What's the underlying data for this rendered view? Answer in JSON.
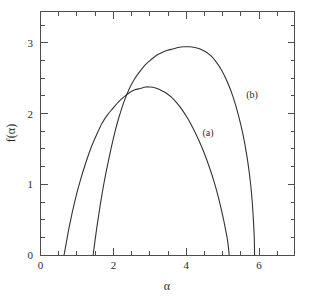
{
  "chart_data": {
    "type": "line",
    "title": "",
    "subtitle": "",
    "xlabel": "α",
    "ylabel": "f(α)",
    "xlim": [
      0,
      7
    ],
    "ylim": [
      0,
      3.45
    ],
    "grid": false,
    "legend_position": "inline-annotations",
    "x_ticks_major": [
      0,
      2,
      4,
      6
    ],
    "x_tick_labels": [
      "0",
      "2",
      "4",
      "6"
    ],
    "x_ticks_minor": [
      0.5,
      1,
      1.5,
      2.5,
      3,
      3.5,
      4.5,
      5,
      5.5,
      6.5,
      7
    ],
    "y_ticks_major": [
      0,
      1,
      2,
      3
    ],
    "y_tick_labels": [
      "0",
      "1",
      "2",
      "3"
    ],
    "y_ticks_minor": [
      0.25,
      0.5,
      0.75,
      1.25,
      1.5,
      1.75,
      2.25,
      2.5,
      2.75,
      3.25
    ],
    "annotations": [
      {
        "text": "(a)",
        "x": 3.72,
        "y": 1.76
      },
      {
        "text": "(b)",
        "x": 5.05,
        "y": 2.3
      }
    ],
    "series": [
      {
        "name": "(a)",
        "label": "(a)",
        "color": "#333333",
        "x_start": 0.65,
        "x_end": 5.2,
        "peak_x": 3.0,
        "peak_y": 2.38,
        "points": [
          [
            0.65,
            0.0
          ],
          [
            0.8,
            0.42
          ],
          [
            0.95,
            0.77
          ],
          [
            1.1,
            1.06
          ],
          [
            1.25,
            1.31
          ],
          [
            1.4,
            1.53
          ],
          [
            1.55,
            1.71
          ],
          [
            1.7,
            1.87
          ],
          [
            1.85,
            1.99
          ],
          [
            2.0,
            2.08
          ],
          [
            2.15,
            2.17
          ],
          [
            2.3,
            2.24
          ],
          [
            2.45,
            2.3
          ],
          [
            2.6,
            2.34
          ],
          [
            2.75,
            2.36
          ],
          [
            2.9,
            2.38
          ],
          [
            3.0,
            2.38
          ],
          [
            3.15,
            2.37
          ],
          [
            3.3,
            2.34
          ],
          [
            3.45,
            2.3
          ],
          [
            3.6,
            2.24
          ],
          [
            3.75,
            2.16
          ],
          [
            3.9,
            2.06
          ],
          [
            4.05,
            1.94
          ],
          [
            4.2,
            1.8
          ],
          [
            4.35,
            1.64
          ],
          [
            4.5,
            1.46
          ],
          [
            4.65,
            1.25
          ],
          [
            4.8,
            1.01
          ],
          [
            4.92,
            0.78
          ],
          [
            5.02,
            0.56
          ],
          [
            5.1,
            0.36
          ],
          [
            5.16,
            0.19
          ],
          [
            5.2,
            0.0
          ]
        ]
      },
      {
        "name": "(b)",
        "label": "(b)",
        "color": "#333333",
        "x_start": 1.45,
        "x_end": 5.9,
        "peak_x": 4.1,
        "peak_y": 2.95,
        "points": [
          [
            1.45,
            0.0
          ],
          [
            1.55,
            0.38
          ],
          [
            1.65,
            0.72
          ],
          [
            1.75,
            1.02
          ],
          [
            1.85,
            1.28
          ],
          [
            1.95,
            1.52
          ],
          [
            2.05,
            1.74
          ],
          [
            2.15,
            1.93
          ],
          [
            2.3,
            2.17
          ],
          [
            2.45,
            2.36
          ],
          [
            2.6,
            2.5
          ],
          [
            2.75,
            2.61
          ],
          [
            2.9,
            2.7
          ],
          [
            3.05,
            2.77
          ],
          [
            3.2,
            2.83
          ],
          [
            3.35,
            2.87
          ],
          [
            3.5,
            2.9
          ],
          [
            3.65,
            2.92
          ],
          [
            3.8,
            2.94
          ],
          [
            3.95,
            2.95
          ],
          [
            4.1,
            2.95
          ],
          [
            4.25,
            2.94
          ],
          [
            4.4,
            2.92
          ],
          [
            4.55,
            2.88
          ],
          [
            4.7,
            2.82
          ],
          [
            4.85,
            2.73
          ],
          [
            5.0,
            2.61
          ],
          [
            5.15,
            2.45
          ],
          [
            5.3,
            2.25
          ],
          [
            5.45,
            1.99
          ],
          [
            5.58,
            1.71
          ],
          [
            5.68,
            1.43
          ],
          [
            5.76,
            1.14
          ],
          [
            5.82,
            0.85
          ],
          [
            5.86,
            0.56
          ],
          [
            5.89,
            0.26
          ],
          [
            5.9,
            0.0
          ]
        ]
      }
    ]
  },
  "axis": {
    "x_title": "α",
    "y_title": "f(α)"
  },
  "labels": {
    "curve_a": "(a)",
    "curve_b": "(b)",
    "x0": "0",
    "x2": "2",
    "x4": "4",
    "x6": "6",
    "y0": "0",
    "y1": "1",
    "y2": "2",
    "y3": "3"
  }
}
